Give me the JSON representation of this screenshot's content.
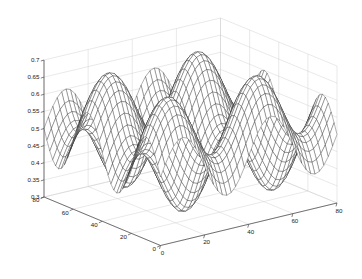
{
  "figure": {
    "kind": "matlab-3d-mesh-plot",
    "background_color": "#ffffff",
    "mesh_color": "#1c1c1c",
    "grid_color": "#c8c8c8",
    "axis_color": "#4a4a4a"
  },
  "chart_data": {
    "type": "surface",
    "title": "",
    "xlabel": "",
    "ylabel": "",
    "zlabel": "",
    "grid": true,
    "legend": "none",
    "projection": "3d-mesh",
    "view": {
      "azimuth": -37.5,
      "elevation": 30
    },
    "xlim": [
      0,
      80
    ],
    "ylim": [
      0,
      80
    ],
    "zlim": [
      0.3,
      0.7
    ],
    "xticks": [
      0,
      20,
      40,
      60,
      80
    ],
    "yticks": [
      0,
      20,
      40,
      60,
      80
    ],
    "zticks": [
      0.3,
      0.35,
      0.4,
      0.45,
      0.5,
      0.55,
      0.6,
      0.65,
      0.7
    ],
    "xtick_labels": [
      "0",
      "20",
      "40",
      "60",
      "80"
    ],
    "ytick_labels": [
      "0",
      "20",
      "40",
      "60",
      "80"
    ],
    "ztick_labels": [
      "0.3",
      "0.35",
      "0.4",
      "0.45",
      "0.5",
      "0.55",
      "0.6",
      "0.65",
      "0.7"
    ],
    "surface_function": {
      "expression": "z = 0.5 + 0.1*sin(2*pi*x/40) + 0.1*sin(2*pi*y/40)",
      "z_offset": 0.5,
      "amp_x": 0.1,
      "amp_y": 0.1,
      "period_x": 40,
      "period_y": 40,
      "grid_n": 41
    },
    "z_min_observed": 0.3,
    "z_max_observed": 0.7
  }
}
